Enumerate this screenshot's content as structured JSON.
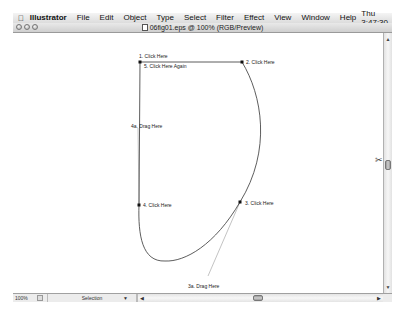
{
  "menubar": {
    "apple_icon": "",
    "app_name": "Illustrator",
    "items": [
      "File",
      "Edit",
      "Object",
      "Type",
      "Select",
      "Filter",
      "Effect",
      "View",
      "Window",
      "Help"
    ],
    "clock": "Thu 3:47:30"
  },
  "window": {
    "title": "06fig01.eps @ 100% (RGB/Preview)"
  },
  "canvas": {
    "labels": {
      "p1": "1. Click Here",
      "p5": "5. Click Here Again",
      "p2": "2. Click Here",
      "p4a": "4a. Drag Here",
      "p4": "4. Click Here",
      "p3": "3. Click Here",
      "p3a": "3a. Drag Here"
    }
  },
  "statusbar": {
    "zoom": "100%",
    "status": "Selection"
  },
  "scrollbars": {
    "up_arrow": "▲",
    "down_arrow": "▼",
    "left_arrow": "◀",
    "right_arrow": "▶"
  }
}
